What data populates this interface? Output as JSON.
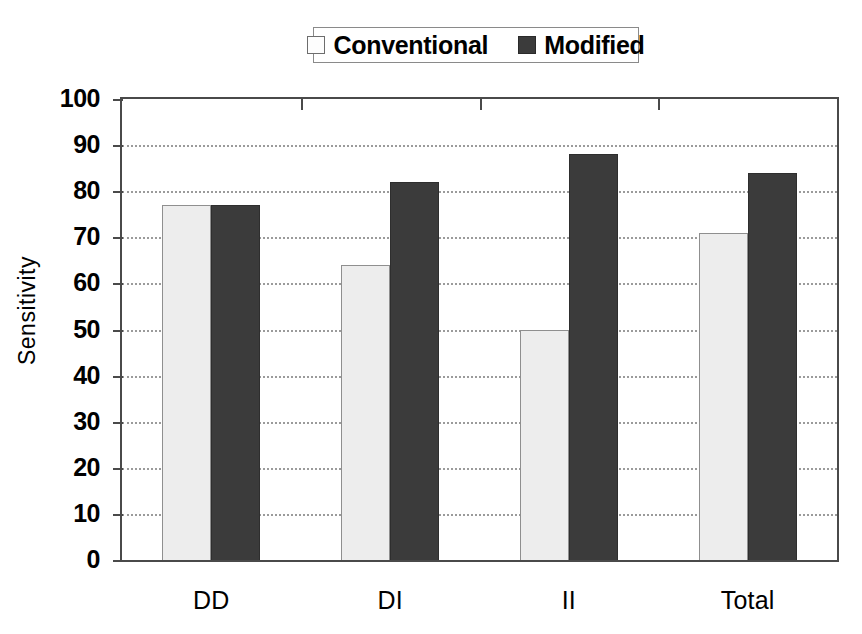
{
  "chart_data": {
    "type": "bar",
    "title": "",
    "xlabel": "",
    "ylabel": "Sensitivity",
    "categories": [
      "DD",
      "DI",
      "II",
      "Total"
    ],
    "series": [
      {
        "name": "Conventional",
        "values": [
          77,
          64,
          50,
          71
        ],
        "color": "#ededed"
      },
      {
        "name": "Modified",
        "values": [
          77,
          82,
          88,
          84
        ],
        "color": "#3b3b3b"
      }
    ],
    "ylim": [
      0,
      100
    ],
    "ytick_step": 10,
    "yticks": [
      0,
      10,
      20,
      30,
      40,
      50,
      60,
      70,
      80,
      90,
      100
    ],
    "ytick_labels": [
      "0",
      "10",
      "20",
      "30",
      "40",
      "50",
      "60",
      "70",
      "80",
      "90",
      "100"
    ],
    "grid": true,
    "grid_style": "dotted",
    "grid_axis": "y",
    "legend_position": "top-center",
    "legend_entries": [
      "Conventional",
      "Modified"
    ],
    "plot_border": true
  },
  "legend": {
    "entries": [
      {
        "label": "Conventional",
        "swatch": "legend-swatch-conventional"
      },
      {
        "label": "Modified",
        "swatch": "legend-swatch-modified"
      }
    ]
  },
  "axes": {
    "y_title": "Sensitivity",
    "y_labels": [
      "100",
      "90",
      "80",
      "70",
      "60",
      "50",
      "40",
      "30",
      "20",
      "10",
      "0"
    ],
    "x_labels": [
      "DD",
      "DI",
      "II",
      "Total"
    ]
  }
}
